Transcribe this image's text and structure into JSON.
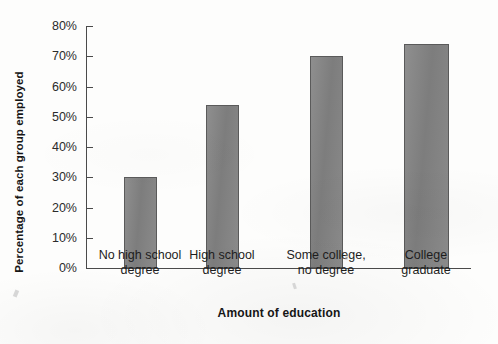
{
  "chart_data": {
    "type": "bar",
    "title": "",
    "xlabel": "Amount of education",
    "ylabel": "Percentage of each group employed",
    "categories": [
      "No high school\ndegree",
      "High school\ndegree",
      "Some college,\nno degree",
      "College\ngraduate"
    ],
    "values": [
      30,
      54,
      70,
      74
    ],
    "ylim": [
      0,
      80
    ],
    "ytick_values": [
      0,
      10,
      20,
      30,
      40,
      50,
      60,
      70,
      80
    ],
    "ytick_labels": [
      "0%",
      "10%",
      "20%",
      "30%",
      "40%",
      "50%",
      "60%",
      "70%",
      "80%"
    ],
    "grid": false,
    "legend": false,
    "bar_color": "#828282",
    "bar_edge_color": "#5a5a5a",
    "axis_color": "#4a4a4a"
  }
}
